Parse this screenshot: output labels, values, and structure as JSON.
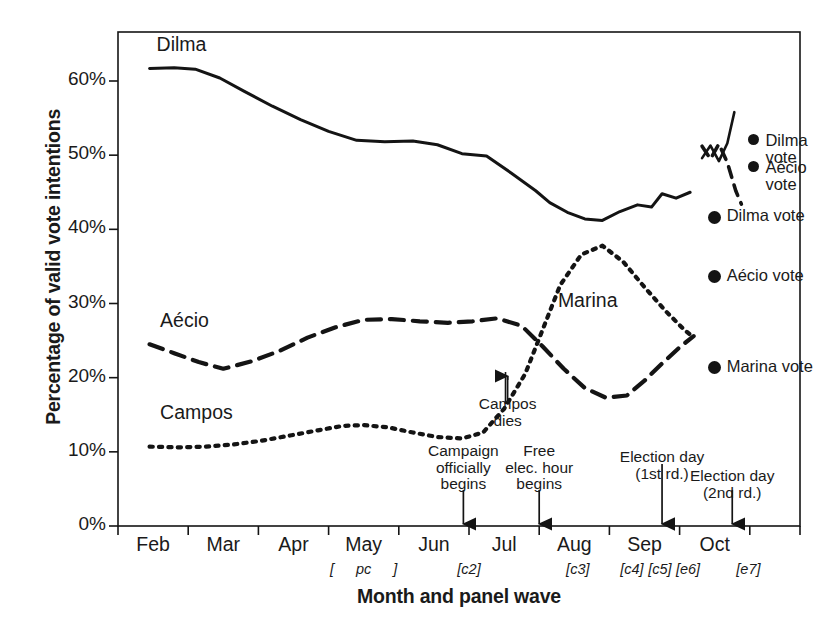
{
  "chart_data": {
    "type": "line",
    "title": "",
    "xlabel": "Month and panel wave",
    "ylabel": "Percentage of valid vote intentions",
    "ylim": [
      0,
      65
    ],
    "yticks": [
      "0%",
      "10%",
      "20%",
      "30%",
      "40%",
      "50%",
      "60%"
    ],
    "ytick_values": [
      0,
      10,
      20,
      30,
      40,
      50,
      60
    ],
    "xticks": [
      "Feb",
      "Mar",
      "Apr",
      "May",
      "Jun",
      "Jul",
      "Aug",
      "Sep",
      "Oct"
    ],
    "grid": false,
    "legend_position": "inline-right",
    "panel_waves": [
      {
        "label": "[",
        "month_pos": 4.05
      },
      {
        "label": "pc",
        "month_pos": 4.5
      },
      {
        "label": "]",
        "month_pos": 4.95
      },
      {
        "label": "[c2]",
        "month_pos": 6.0
      },
      {
        "label": "[c3]",
        "month_pos": 7.55
      },
      {
        "label": "[c4]",
        "month_pos": 8.32
      },
      {
        "label": "[c5]",
        "month_pos": 8.72
      },
      {
        "label": "[e6]",
        "month_pos": 9.12
      },
      {
        "label": "[e7]",
        "month_pos": 9.98
      }
    ],
    "series": [
      {
        "name": "Dilma",
        "style": "solid",
        "label_pos": {
          "month": 1.55,
          "value": 64.4
        },
        "x": [
          1.45,
          1.8,
          2.1,
          2.45,
          2.8,
          3.2,
          3.6,
          4.0,
          4.4,
          4.8,
          5.2,
          5.55,
          5.9,
          6.25,
          6.6,
          6.95,
          7.15,
          7.4,
          7.65,
          7.9,
          8.15,
          8.4,
          8.6,
          8.75,
          8.95,
          9.15
        ],
        "values": [
          61.7,
          61.8,
          61.6,
          60.4,
          58.6,
          56.6,
          54.8,
          53.2,
          52.0,
          51.8,
          51.9,
          51.4,
          50.2,
          49.9,
          47.6,
          45.2,
          43.6,
          42.3,
          41.4,
          41.2,
          42.4,
          43.3,
          43.0,
          44.8,
          44.2,
          45.0
        ]
      },
      {
        "name": "Aécio",
        "style": "dashed",
        "label_pos": {
          "month": 1.6,
          "value": 27.2
        },
        "x": [
          1.45,
          1.8,
          2.15,
          2.5,
          2.9,
          3.3,
          3.7,
          4.1,
          4.5,
          4.9,
          5.3,
          5.7,
          6.05,
          6.4,
          6.75,
          7.05,
          7.35,
          7.65,
          7.95,
          8.25,
          8.5,
          8.75,
          9.0,
          9.2
        ],
        "values": [
          24.5,
          23.3,
          22.1,
          21.2,
          22.2,
          23.6,
          25.4,
          26.8,
          27.8,
          27.9,
          27.6,
          27.4,
          27.6,
          28.0,
          27.0,
          24.2,
          21.2,
          18.6,
          17.3,
          17.6,
          19.6,
          21.9,
          24.1,
          25.6
        ]
      },
      {
        "name": "Campos",
        "alt_name": "Marina",
        "style": "dotted",
        "label_pos": {
          "month": 1.6,
          "value": 14.8
        },
        "marina_label_pos": {
          "month": 7.95,
          "value": 29.9
        },
        "x": [
          1.45,
          1.85,
          2.25,
          2.65,
          3.05,
          3.45,
          3.85,
          4.2,
          4.5,
          4.85,
          5.2,
          5.55,
          5.9,
          6.2,
          6.5,
          6.8,
          7.05,
          7.3,
          7.6,
          7.9,
          8.2,
          8.5,
          8.8,
          9.05,
          9.2
        ],
        "values": [
          10.7,
          10.6,
          10.7,
          11.0,
          11.5,
          12.2,
          12.9,
          13.5,
          13.6,
          13.3,
          12.6,
          12.0,
          11.8,
          12.6,
          15.8,
          20.5,
          26.5,
          32.5,
          36.6,
          37.8,
          35.6,
          32.2,
          29.0,
          26.6,
          25.4
        ]
      }
    ],
    "runoff_series": [
      {
        "name": "Dilma runoff",
        "style": "solid",
        "x": [
          9.32,
          9.44,
          9.56,
          9.68,
          9.78
        ],
        "values": [
          49.6,
          51.3,
          49.2,
          51.6,
          55.8
        ]
      },
      {
        "name": "Aécio runoff",
        "style": "dashed",
        "x": [
          9.32,
          9.44,
          9.56,
          9.68,
          9.8,
          9.88
        ],
        "values": [
          51.2,
          49.5,
          51.5,
          49.0,
          45.2,
          43.4
        ]
      }
    ],
    "vote_markers": [
      {
        "label": "Dilma vote",
        "round": 1,
        "value": 41.6,
        "month_pos": 9.4
      },
      {
        "label": "Aécio vote",
        "round": 1,
        "value": 33.6,
        "month_pos": 9.4
      },
      {
        "label": "Marina vote",
        "round": 1,
        "value": 21.3,
        "month_pos": 9.4
      },
      {
        "label": "Dilma\nvote",
        "round": 2,
        "value": 51.8,
        "month_pos": 9.98
      },
      {
        "label": "Aécio\nvote",
        "round": 2,
        "value": 48.2,
        "month_pos": 9.98
      }
    ],
    "annotations": [
      {
        "text": "Campos\ndies",
        "month_pos": 6.55,
        "arrow": "up-short"
      },
      {
        "text": "Campaign\nofficially\nbegins",
        "month_pos": 5.92,
        "arrow": "down-axis"
      },
      {
        "text": "Free\nelec. hour\nbegins",
        "month_pos": 7.0,
        "arrow": "down-axis"
      },
      {
        "text": "Election day\n(1st rd.)",
        "month_pos": 8.75,
        "arrow": "down-axis-long"
      },
      {
        "text": "Election day\n(2nd rd.)",
        "month_pos": 9.75,
        "arrow": "down-axis"
      }
    ]
  },
  "axis": {
    "y_title": "Percentage of valid vote intentions",
    "x_title": "Month and panel wave",
    "y_labels": [
      "60%",
      "50%",
      "40%",
      "30%",
      "20%",
      "10%",
      "0%"
    ],
    "x_labels": [
      "Feb",
      "Mar",
      "Apr",
      "May",
      "Jun",
      "Jul",
      "Aug",
      "Sep",
      "Oct"
    ]
  },
  "series_labels": {
    "dilma": "Dilma",
    "aecio": "Aécio",
    "campos": "Campos",
    "marina": "Marina"
  },
  "wave_labels": {
    "open_bracket": "[",
    "pc": "pc",
    "close_bracket": "]",
    "c2": "[c2]",
    "c3": "[c3]",
    "c4": "[c4]",
    "c5": "[c5]",
    "e6": "[e6]",
    "e7": "[e7]"
  },
  "annotation_text": {
    "campos_dies": "Campos\ndies",
    "campaign_begins": "Campaign\nofficially\nbegins",
    "free_elec_hour": "Free\nelec. hour\nbegins",
    "election_1st": "Election day\n(1st rd.)",
    "election_2nd": "Election day\n(2nd rd.)"
  },
  "legend": {
    "dilma_vote": "Dilma vote",
    "aecio_vote": "Aécio vote",
    "marina_vote": "Marina vote",
    "dilma_vote_2": "Dilma\nvote",
    "aecio_vote_2": "Aécio\nvote"
  },
  "colors": {
    "ink": "#141414",
    "background": "#ffffff"
  }
}
